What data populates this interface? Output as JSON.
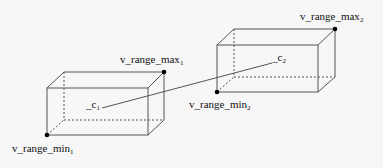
{
  "diagram": {
    "type": "two bounding boxes connected by a line between centers",
    "boxes": [
      {
        "id": "box1",
        "center_label": "_c",
        "center_sub": "1",
        "max_label": "v_range_max",
        "max_sub": "1",
        "min_label": "v_range_min",
        "min_sub": "1"
      },
      {
        "id": "box2",
        "center_label": "_c",
        "center_sub": "2",
        "max_label": "v_range_max",
        "max_sub": "2",
        "min_label": "v_range_min",
        "min_sub": "2"
      }
    ],
    "colors": {
      "background": "#f7f7f7",
      "edge": "#555555",
      "dot": "#000000",
      "text": "#111111"
    }
  }
}
